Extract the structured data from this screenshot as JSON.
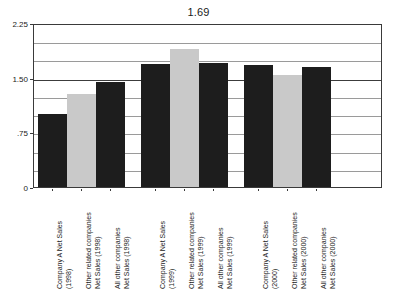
{
  "chart_data": {
    "type": "bar",
    "title": "1.69",
    "xlabel": "",
    "ylabel": "",
    "ylim": [
      0,
      2.25
    ],
    "grid": true,
    "legend": null,
    "y_ticks": [
      {
        "value": 2.25,
        "label": "2.25",
        "major": true
      },
      {
        "value": 2.0,
        "label": "",
        "major": false
      },
      {
        "value": 1.75,
        "label": "",
        "major": false
      },
      {
        "value": 1.5,
        "label": "1.50",
        "major": true
      },
      {
        "value": 1.25,
        "label": "",
        "major": false
      },
      {
        "value": 1.0,
        "label": "",
        "major": false
      },
      {
        "value": 0.75,
        "label": ".75",
        "major": false
      },
      {
        "value": 0.5,
        "label": "",
        "major": false
      },
      {
        "value": 0.25,
        "label": "",
        "major": false
      },
      {
        "value": 0.0,
        "label": "0",
        "major": true
      }
    ],
    "categories": [
      "Company A Net Sales (1998)",
      "Other related companies Net Sales (1998)",
      "All other companies Net Sales (1998)",
      "Company A Net Sales (1999)",
      "Other related companies Net Sales (1999)",
      "All other companies Net Sales (1999)",
      "Company A Net Sales (2000)",
      "Other related companies Net Sales (2000)",
      "All other companies Net Sales (2000)"
    ],
    "values": [
      1.0,
      1.28,
      1.44,
      1.69,
      1.9,
      1.7,
      1.68,
      1.54,
      1.64
    ],
    "bars": [
      {
        "id": "bar-company-a-1998",
        "value": 1.0,
        "color": "#1d1d1d",
        "style": "dark",
        "group": "1998",
        "label_lines": [
          "Company A Net Sales",
          "(1998)"
        ]
      },
      {
        "id": "bar-other-related-1998",
        "value": 1.28,
        "color": "#c9c9c9",
        "style": "light",
        "group": "1998",
        "label_lines": [
          "Other related companies",
          "Net Sales (1998)"
        ]
      },
      {
        "id": "bar-all-other-1998",
        "value": 1.44,
        "color": "#1d1d1d",
        "style": "dark",
        "group": "1998",
        "label_lines": [
          "All other companies",
          "Net Sales (1998)"
        ]
      },
      {
        "id": "bar-company-a-1999",
        "value": 1.69,
        "color": "#1d1d1d",
        "style": "dark",
        "group": "1999",
        "label_lines": [
          "Company A Net Sales",
          "(1999)"
        ]
      },
      {
        "id": "bar-other-related-1999",
        "value": 1.9,
        "color": "#c9c9c9",
        "style": "light",
        "group": "1999",
        "label_lines": [
          "Other related companies",
          "Net Sales (1999)"
        ]
      },
      {
        "id": "bar-all-other-1999",
        "value": 1.7,
        "color": "#1d1d1d",
        "style": "dark",
        "group": "1999",
        "label_lines": [
          "All other companies",
          "Net Sales (1999)"
        ]
      },
      {
        "id": "bar-company-a-2000",
        "value": 1.68,
        "color": "#1d1d1d",
        "style": "dark",
        "group": "2000",
        "label_lines": [
          "Company A Net Sales",
          "(2000)"
        ]
      },
      {
        "id": "bar-other-related-2000",
        "value": 1.54,
        "color": "#c9c9c9",
        "style": "light",
        "group": "2000",
        "label_lines": [
          "Other related companies",
          "Net Sales (2000)"
        ]
      },
      {
        "id": "bar-all-other-2000",
        "value": 1.64,
        "color": "#1d1d1d",
        "style": "dark",
        "group": "2000",
        "label_lines": [
          "All other companies",
          "Net Sales (2000)"
        ]
      }
    ],
    "colors": {
      "dark_bar": "#1d1d1d",
      "light_bar": "#c9c9c9",
      "gridline": "#9a9a9a",
      "gridline_major": "#3c3c3c",
      "axis": "#3a3a3a",
      "text": "#1a1a1a",
      "background": "#ffffff"
    }
  }
}
